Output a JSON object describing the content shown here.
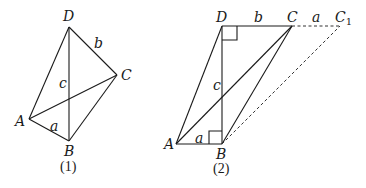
{
  "figures": [
    {
      "id": "fig1",
      "caption": "(1)",
      "vertices": {
        "A": "A",
        "B": "B",
        "C": "C",
        "D": "D"
      },
      "edge_labels": {
        "AB": "a",
        "DC": "b",
        "DB": "c"
      }
    },
    {
      "id": "fig2",
      "caption": "(2)",
      "vertices": {
        "A": "A",
        "B": "B",
        "C": "C",
        "D": "D",
        "C1": "C",
        "C1_sub": "1"
      },
      "edge_labels": {
        "AB": "a",
        "DC": "b",
        "DB": "c",
        "CC1": "a"
      },
      "right_angles": [
        "D",
        "B"
      ]
    }
  ],
  "colors": {
    "line": "#1a1a1a",
    "background": "#ffffff"
  }
}
